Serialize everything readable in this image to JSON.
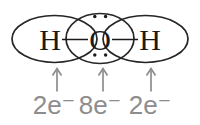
{
  "diagram": {
    "atoms": [
      {
        "symbol": "H",
        "electrons_label": "2e⁻"
      },
      {
        "symbol": "O",
        "electrons_label": "8e⁻"
      },
      {
        "symbol": "H",
        "electrons_label": "2e⁻"
      }
    ],
    "oxygen_lone_pair_dots": {
      "top": 2,
      "bottom": 2
    },
    "colors": {
      "shell_outline": "#262626",
      "atom_text": "#1a1a1a",
      "annotation_gray": "#8d8d8d",
      "background": "#ffffff"
    }
  }
}
